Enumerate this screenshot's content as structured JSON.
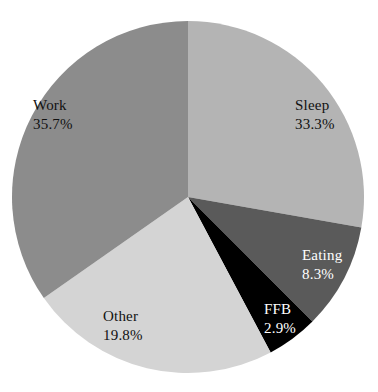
{
  "chart_data": {
    "type": "pie",
    "title": "",
    "start_angle_deg": 0,
    "direction": "clockwise",
    "slices": [
      {
        "label": "Sleep",
        "value": 33.3,
        "display": "33.3%",
        "color": "#b4b4b4",
        "label_color": "#111111",
        "draw_from": 0,
        "draw_to": 100
      },
      {
        "label": "Eating",
        "value": 8.3,
        "display": "8.3%",
        "color": "#5a5a5a",
        "label_color": "#ffffff",
        "draw_from": 100,
        "draw_to": 135
      },
      {
        "label": "FFB",
        "value": 2.9,
        "display": "2.9%",
        "color": "#000000",
        "label_color": "#ffffff",
        "draw_from": 135,
        "draw_to": 152
      },
      {
        "label": "Other",
        "value": 19.8,
        "display": "19.8%",
        "color": "#d4d4d4",
        "label_color": "#111111",
        "draw_from": 152,
        "draw_to": 235
      },
      {
        "label": "Work",
        "value": 35.7,
        "display": "35.7%",
        "color": "#8c8c8c",
        "label_color": "#111111",
        "draw_from": 235,
        "draw_to": 360
      }
    ],
    "legend": "none",
    "labels_inside": true
  },
  "labels": {
    "sleep": {
      "name": "Sleep",
      "pct": "33.3%"
    },
    "eating": {
      "name": "Eating",
      "pct": "8.3%"
    },
    "ffb": {
      "name": "FFB",
      "pct": "2.9%"
    },
    "other": {
      "name": "Other",
      "pct": "19.8%"
    },
    "work": {
      "name": "Work",
      "pct": "35.7%"
    }
  }
}
